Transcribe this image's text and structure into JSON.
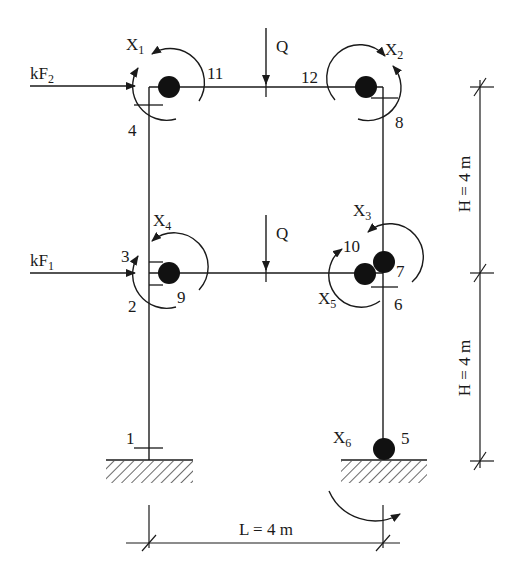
{
  "diagram": {
    "type": "two-storey portal frame with plastic hinges",
    "loads": {
      "top_horizontal": {
        "label": "kF",
        "sub": "2"
      },
      "mid_horizontal": {
        "label": "kF",
        "sub": "1"
      },
      "top_vertical": {
        "label": "Q"
      },
      "mid_vertical": {
        "label": "Q"
      }
    },
    "moments": [
      {
        "id": "X1",
        "label": "X",
        "sub": "1"
      },
      {
        "id": "X2",
        "label": "X",
        "sub": "2"
      },
      {
        "id": "X3",
        "label": "X",
        "sub": "3"
      },
      {
        "id": "X4",
        "label": "X",
        "sub": "4"
      },
      {
        "id": "X5",
        "label": "X",
        "sub": "5"
      },
      {
        "id": "X6",
        "label": "X",
        "sub": "6"
      }
    ],
    "sections": [
      "1",
      "2",
      "3",
      "4",
      "5",
      "6",
      "7",
      "8",
      "9",
      "10",
      "11",
      "12"
    ],
    "dimensions": {
      "height_upper": "H = 4 m",
      "height_lower": "H = 4 m",
      "span": "L = 4 m"
    },
    "colors": {
      "line": "#1a1a1a",
      "hinge": "#111111",
      "background": "#ffffff"
    }
  }
}
